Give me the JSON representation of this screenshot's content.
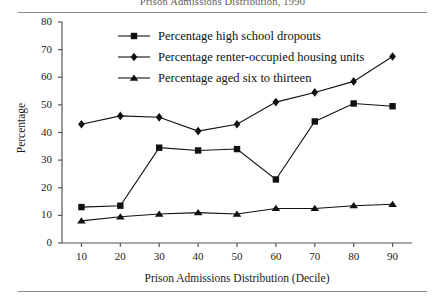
{
  "chart_data": {
    "type": "line",
    "title": "Prison Admissions Distribution, 1990",
    "xlabel": "Prison Admissions Distribution (Decile)",
    "ylabel": "Percentage",
    "x": [
      10,
      20,
      30,
      40,
      50,
      60,
      70,
      80,
      90
    ],
    "xtick_labels": [
      "10",
      "20",
      "30",
      "40",
      "50",
      "60",
      "70",
      "80",
      "90"
    ],
    "ytick_labels": [
      "0",
      "10",
      "20",
      "30",
      "40",
      "50",
      "60",
      "70",
      "80"
    ],
    "xlim": [
      5,
      95
    ],
    "ylim": [
      0,
      80
    ],
    "grid": false,
    "legend_position": "top-center",
    "series": [
      {
        "name": "Percentage high school dropouts",
        "marker": "square",
        "values": [
          13,
          13.5,
          34.5,
          33.5,
          34,
          23,
          44,
          50.5,
          49.5
        ]
      },
      {
        "name": "Percentage renter-occupied housing units",
        "marker": "diamond",
        "values": [
          43,
          46,
          45.5,
          40.5,
          43,
          51,
          54.5,
          58.5,
          67.5
        ]
      },
      {
        "name": "Percentage aged six to thirteen",
        "marker": "triangle",
        "values": [
          8,
          9.5,
          10.5,
          11,
          10.5,
          12.5,
          12.5,
          13.5,
          14
        ]
      }
    ]
  },
  "colors": {
    "ink": "#111111",
    "axis": "#555555",
    "rule": "#8a8a8a",
    "title": "#5a5a5a",
    "background": "#ffffff"
  }
}
